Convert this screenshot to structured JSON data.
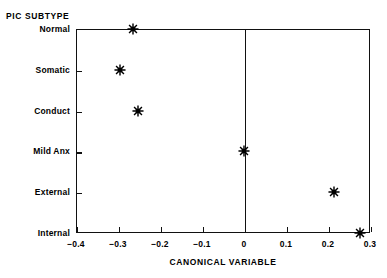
{
  "chart_data": {
    "type": "scatter",
    "title": "",
    "xlabel": "CANONICAL VARIABLE",
    "ylabel": "PIC SUBTYPE",
    "xlim": [
      -0.4,
      0.3
    ],
    "ylim_categories": [
      "Normal",
      "Somatic",
      "Conduct",
      "Mild Anx",
      "External",
      "Internal"
    ],
    "xticks": [
      -0.4,
      -0.3,
      -0.2,
      -0.1,
      0,
      0.1,
      0.2,
      0.3
    ],
    "xticklabels": [
      "-0.4",
      "-0.3",
      "-0.2",
      "-0.1",
      "0",
      "0.1",
      "0.2",
      "0.3"
    ],
    "yticklabels": [
      "Normal",
      "Somatic",
      "Conduct",
      "Mild Anx",
      "External",
      "Internal"
    ],
    "grid": false,
    "legend": null,
    "marker": "asterisk",
    "reference_line_x": 0,
    "points": [
      {
        "category": "Normal",
        "x": -0.265
      },
      {
        "category": "Somatic",
        "x": -0.295
      },
      {
        "category": "Conduct",
        "x": -0.252
      },
      {
        "category": "Mild Anx",
        "x": 0.0
      },
      {
        "category": "External",
        "x": 0.215
      },
      {
        "category": "Internal",
        "x": 0.277
      }
    ],
    "colors": {
      "axis": "#111111",
      "marker": "#000000",
      "background": "#ffffff"
    }
  },
  "axis_titles": {
    "group_header": "PIC SUBTYPE",
    "x_axis": "CANONICAL VARIABLE"
  }
}
